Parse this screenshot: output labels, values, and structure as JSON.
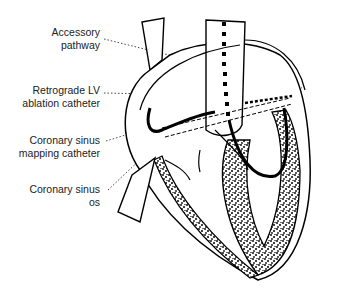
{
  "figure": {
    "type": "anatomical-diagram",
    "labels": [
      {
        "id": "accessory-pathway",
        "lines": [
          "Accessory",
          "pathway"
        ]
      },
      {
        "id": "retrograde-lv-ablation-catheter",
        "lines": [
          "Retrograde LV",
          "ablation catheter"
        ]
      },
      {
        "id": "coronary-sinus-mapping-catheter",
        "lines": [
          "Coronary sinus",
          "mapping catheter"
        ]
      },
      {
        "id": "coronary-sinus-os",
        "lines": [
          "Coronary sinus",
          "os"
        ]
      }
    ]
  }
}
